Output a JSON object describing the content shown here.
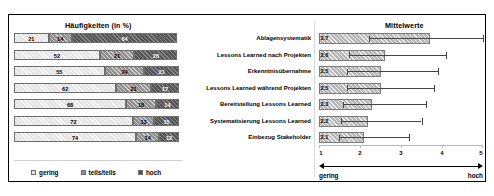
{
  "chart_data": [
    {
      "type": "bar",
      "title": "Häufigkeiten (in %)",
      "orientation": "horizontal",
      "stacked": true,
      "xlabel": "",
      "ylabel": "",
      "xlim": [
        0,
        100
      ],
      "grid": false,
      "legend_position": "bottom",
      "categories": [
        "Ablagensystematik",
        "Lessons Learned nach Projekten",
        "Erkenntnisübernahme",
        "Lessons Learned während Projekten",
        "Bereitstellung Lessons Learned",
        "Systematisierung Lessons Learned",
        "Einbezug Stakeholder"
      ],
      "series": [
        {
          "name": "gering",
          "color": "#e3e3e3",
          "values": [
            21,
            52,
            55,
            62,
            68,
            72,
            74
          ]
        },
        {
          "name": "teils/teils",
          "color": "#8f8f8f",
          "values": [
            14,
            21,
            24,
            21,
            18,
            13,
            14
          ]
        },
        {
          "name": "hoch",
          "color": "#555555",
          "values": [
            64,
            26,
            21,
            17,
            14,
            15,
            12
          ]
        }
      ]
    },
    {
      "type": "bar",
      "title": "Mittelwerte",
      "orientation": "horizontal",
      "stacked": false,
      "xlabel": "",
      "ylabel": "",
      "xlim": [
        1,
        5
      ],
      "xticks": [
        "1",
        "2",
        "3",
        "4",
        "5"
      ],
      "grid": false,
      "legend_position": "none",
      "categories": [
        "Ablagensystematik",
        "Lessons Learned nach Projekten",
        "Erkenntnisübernahme",
        "Lessons Learned während Projekten",
        "Bereitstellung Lessons Learned",
        "Systematisierung Lessons Learned",
        "Einbezug Stakeholder"
      ],
      "values": [
        3.7,
        2.6,
        2.5,
        2.5,
        2.3,
        2.2,
        2.1
      ],
      "value_labels": [
        "3.7",
        "2.6",
        "2.5",
        "2.5",
        "2.3",
        "2.2",
        "2.1"
      ],
      "error_high": [
        5.0,
        4.1,
        3.9,
        3.8,
        3.6,
        3.5,
        3.2
      ],
      "scale_anchor_low": "gering",
      "scale_anchor_high": "hoch"
    }
  ],
  "left_panel": {
    "title": "Häufigkeiten (in %)",
    "rows": [
      {
        "label": "Ablagensystematik",
        "gering": "21",
        "teils": "14",
        "hoch": "64"
      },
      {
        "label": "Lessons Learned nach Projekten",
        "gering": "52",
        "teils": "21",
        "hoch": "26"
      },
      {
        "label": "Erkenntnisübernahme",
        "gering": "55",
        "teils": "24",
        "hoch": "21"
      },
      {
        "label": "Lessons Learned während Projekten",
        "gering": "62",
        "teils": "21",
        "hoch": "17"
      },
      {
        "label": "Bereitstellung Lessons Learned",
        "gering": "68",
        "teils": "18",
        "hoch": "14"
      },
      {
        "label": "Systematisierung Lessons Learned",
        "gering": "72",
        "teils": "13",
        "hoch": "15"
      },
      {
        "label": "Einbezug Stakeholder",
        "gering": "74",
        "teils": "14",
        "hoch": "12"
      }
    ]
  },
  "right_panel": {
    "title": "Mittelwerte",
    "rows": [
      {
        "value": "3.7"
      },
      {
        "value": "2.6"
      },
      {
        "value": "2.5"
      },
      {
        "value": "2.5"
      },
      {
        "value": "2.3"
      },
      {
        "value": "2.2"
      },
      {
        "value": "2.1"
      }
    ],
    "axis_ticks": [
      "1",
      "2",
      "3",
      "4",
      "5"
    ],
    "anchor_low": "gering",
    "anchor_high": "hoch"
  },
  "legend": {
    "items": [
      {
        "label": "gering",
        "color": "#e3e3e3"
      },
      {
        "label": "teils/teils",
        "color": "#8f8f8f"
      },
      {
        "label": "hoch",
        "color": "#555555"
      }
    ]
  }
}
